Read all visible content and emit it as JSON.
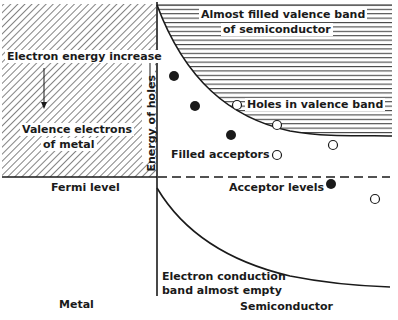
{
  "colors": {
    "ink": "#1a1a1a",
    "background": "#ffffff"
  },
  "metal": {
    "title": "Metal",
    "energy_increase_label": "Electron energy increase",
    "valence_label_line1": "Valence electrons",
    "valence_label_line2": "of metal",
    "fermi_label": "Fermi level"
  },
  "semiconductor": {
    "title": "Semiconductor",
    "valence_band_line1": "Almost filled valence band",
    "valence_band_line2": "of semiconductor",
    "holes_label": "Holes in valence band",
    "filled_acceptors_label": "Filled acceptors",
    "acceptor_levels_label": "Acceptor levels",
    "conduction_line1": "Electron conduction",
    "conduction_line2": "band almost empty",
    "energy_of_holes_label": "Energy of holes"
  },
  "markers": {
    "filled": [
      {
        "x": 174,
        "y": 76
      },
      {
        "x": 195,
        "y": 106
      },
      {
        "x": 231,
        "y": 135
      },
      {
        "x": 331,
        "y": 184
      }
    ],
    "open": [
      {
        "x": 237,
        "y": 105
      },
      {
        "x": 277,
        "y": 125
      },
      {
        "x": 333,
        "y": 145
      },
      {
        "x": 277,
        "y": 155
      },
      {
        "x": 375,
        "y": 199
      }
    ]
  }
}
